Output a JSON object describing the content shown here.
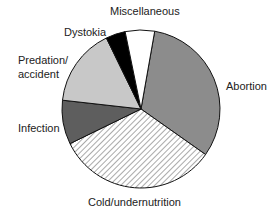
{
  "chart_data": {
    "type": "pie",
    "title": "",
    "start_angle_deg": 10,
    "direction": "clockwise",
    "slices": [
      {
        "label": "Abortion",
        "value": 32,
        "fill": "#8c8c8c",
        "pattern": "solid"
      },
      {
        "label": "Cold/undernutrition",
        "value": 33,
        "fill": "#ffffff",
        "pattern": "hatch"
      },
      {
        "label": "Infection",
        "value": 9,
        "fill": "#5e5e5e",
        "pattern": "solid"
      },
      {
        "label": "Predation/\naccident",
        "value": 16,
        "fill": "#c8c8c8",
        "pattern": "solid"
      },
      {
        "label": "Dystokia",
        "value": 4,
        "fill": "#000000",
        "pattern": "solid"
      },
      {
        "label": "Miscellaneous",
        "value": 6,
        "fill": "#ffffff",
        "pattern": "solid"
      }
    ]
  },
  "labels": {
    "abortion": "Abortion",
    "cold": "Cold/undernutrition",
    "infection": "Infection",
    "predation_line1": "Predation/",
    "predation_line2": "accident",
    "dystokia": "Dystokia",
    "misc": "Miscellaneous"
  }
}
